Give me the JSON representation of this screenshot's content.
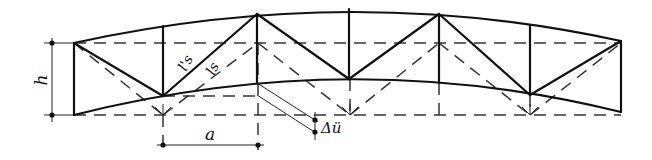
{
  "diagram": {
    "type": "deformed truss (cambered) with undeformed reference",
    "colors": {
      "ink": "#111111",
      "background": "#ffffff"
    },
    "labels": {
      "height": "h",
      "panel": "a",
      "deflection": "Δü",
      "diagonal_deformed": "l's",
      "diagonal_original": "ls"
    }
  }
}
